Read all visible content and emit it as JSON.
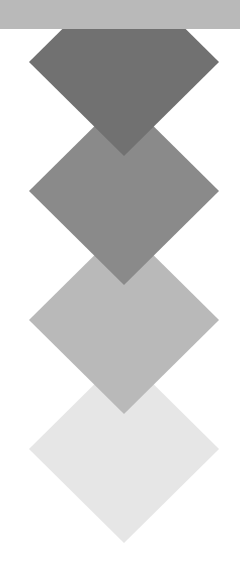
{
  "canvas": {
    "width": 240,
    "height": 584,
    "background": "#ffffff"
  },
  "top_bar": {
    "height": 29,
    "color": "#b9b9b9"
  },
  "diamonds": [
    {
      "name": "diamond-1",
      "cx": 124,
      "cy": 62,
      "half_w": 95,
      "half_h": 94,
      "color": "#717171"
    },
    {
      "name": "diamond-2",
      "cx": 124,
      "cy": 191,
      "half_w": 95,
      "half_h": 94,
      "color": "#8a8a8a"
    },
    {
      "name": "diamond-3",
      "cx": 124,
      "cy": 320,
      "half_w": 95,
      "half_h": 94,
      "color": "#b9b9b9"
    },
    {
      "name": "diamond-4",
      "cx": 124,
      "cy": 449,
      "half_w": 95,
      "half_h": 94,
      "color": "#e6e6e6"
    }
  ]
}
